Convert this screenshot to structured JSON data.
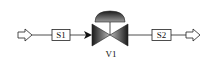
{
  "diagram": {
    "type": "process-flow",
    "nodes": [
      {
        "id": "inlet",
        "kind": "inlet-arrow-icon"
      },
      {
        "id": "S1",
        "kind": "stream-label",
        "label": "S1"
      },
      {
        "id": "V1",
        "kind": "control-valve-icon",
        "label": "V1"
      },
      {
        "id": "S2",
        "kind": "stream-label",
        "label": "S2"
      },
      {
        "id": "outlet",
        "kind": "outlet-arrow-icon"
      }
    ],
    "edges": [
      {
        "from": "inlet",
        "to": "S1"
      },
      {
        "from": "S1",
        "to": "V1",
        "arrowhead": true
      },
      {
        "from": "V1",
        "to": "S2"
      },
      {
        "from": "S2",
        "to": "outlet"
      }
    ]
  },
  "labels": {
    "s1": "S1",
    "s2": "S2",
    "v1": "V1"
  },
  "colors": {
    "line": "#222222",
    "valve_dark": "#1a1a1a",
    "valve_light": "#bfbfbf",
    "background": "#ffffff"
  }
}
